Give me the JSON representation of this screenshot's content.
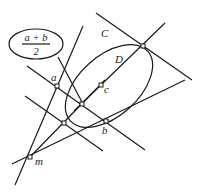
{
  "diagram": {
    "formula": {
      "numerator": "a + b",
      "denominator": "2"
    },
    "labels": {
      "curve": "C",
      "line": "D",
      "point_a": "a",
      "point_b": "b",
      "point_c": "c",
      "point_m": "m"
    },
    "colors": {
      "ink": "#1a1a1a",
      "background": "#ffffff"
    }
  }
}
